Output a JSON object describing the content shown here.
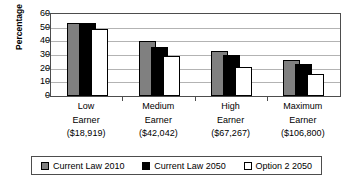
{
  "chart_data": {
    "type": "bar",
    "title": "",
    "subtitle": "",
    "xlabel": "",
    "ylabel": "Percentage",
    "ylim": [
      0,
      60
    ],
    "ytick_labels": [
      "60",
      "50",
      "40",
      "30",
      "20",
      "10",
      "0"
    ],
    "ytick_values": [
      60,
      50,
      40,
      30,
      20,
      10,
      0
    ],
    "grid": true,
    "legend_position": "bottom",
    "bar_overlap": true,
    "categories": [
      "Low\nEarner\n($18,919)",
      "Medium\nEarner\n($42,042)",
      "High\nEarner\n($67,267)",
      "Maximum\nEarner\n($106,800)"
    ],
    "category_lines": [
      [
        "Low",
        "Earner",
        "($18,919)"
      ],
      [
        "Medium",
        "Earner",
        "($42,042)"
      ],
      [
        "High",
        "Earner",
        "($67,267)"
      ],
      [
        "Maximum",
        "Earner",
        "($106,800)"
      ]
    ],
    "series": [
      {
        "name": "Current Law 2010",
        "color": "#808080",
        "values": [
          53.5,
          40.0,
          33.0,
          26.5
        ]
      },
      {
        "name": "Current Law 2050",
        "color": "#000000",
        "values": [
          53.5,
          36.0,
          30.0,
          23.5
        ]
      },
      {
        "name": "Option 2 2050",
        "color": "#ffffff",
        "values": [
          49.0,
          29.0,
          21.0,
          16.0
        ]
      }
    ],
    "annotations": []
  },
  "legend": {
    "items": [
      {
        "label": "Current Law 2010",
        "swatch": "legend-swatch-gray"
      },
      {
        "label": "Current Law 2050",
        "swatch": "legend-swatch-black"
      },
      {
        "label": "Option 2 2050",
        "swatch": "legend-swatch-white"
      }
    ]
  },
  "colors": {
    "series_1": "#808080",
    "series_2": "#000000",
    "series_3": "#ffffff",
    "gridline": "#b3b3b3",
    "axis": "#4d4d4d",
    "text": "#000000",
    "background": "#ffffff"
  }
}
